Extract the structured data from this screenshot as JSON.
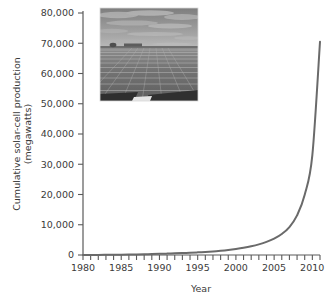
{
  "chart_data": {
    "type": "line",
    "title": "",
    "xlabel": "Year",
    "ylabel": "Cumulative solar-cell production (megawatts)",
    "ylabel_line1": "Cumulative solar-cell production",
    "ylabel_line2": "(megawatts)",
    "xlim": [
      1980,
      2011
    ],
    "ylim": [
      0,
      80000
    ],
    "grid": false,
    "legend": null,
    "x_tick_step": 1,
    "x_label_step": 5,
    "y_tick_step": 10000,
    "xticklabels": [
      "1980",
      "1985",
      "1990",
      "1995",
      "2000",
      "2005",
      "2010"
    ],
    "xticklabel_values": [
      1980,
      1985,
      1990,
      1995,
      2000,
      2005,
      2010
    ],
    "yticklabels": [
      "0",
      "10,000",
      "20,000",
      "30,000",
      "40,000",
      "50,000",
      "60,000",
      "70,000",
      "80,000"
    ],
    "yticklabel_values": [
      0,
      10000,
      20000,
      30000,
      40000,
      50000,
      60000,
      70000,
      80000
    ],
    "series": [
      {
        "name": "Cumulative solar-cell production",
        "color": "#6a6a6a",
        "x": [
          1980,
          1981,
          1982,
          1983,
          1984,
          1985,
          1986,
          1987,
          1988,
          1989,
          1990,
          1991,
          1992,
          1993,
          1994,
          1995,
          1996,
          1997,
          1998,
          1999,
          2000,
          2001,
          2002,
          2003,
          2004,
          2005,
          2006,
          2007,
          2008,
          2009,
          2010,
          2011
        ],
        "values": [
          5,
          15,
          30,
          55,
          85,
          120,
          160,
          205,
          255,
          315,
          380,
          455,
          540,
          635,
          745,
          870,
          1015,
          1190,
          1405,
          1670,
          2005,
          2405,
          2900,
          3520,
          4330,
          5420,
          6960,
          9240,
          13100,
          19900,
          33000,
          70500
        ]
      }
    ],
    "annotations": []
  },
  "inset_photo": {
    "name": "solar-panel-farm-photo",
    "description": "Grayscale photograph of a large solar panel array field under a cloudy sky",
    "sky_top": "#8e8e8e",
    "sky_bottom": "#b4b4b4",
    "panel_dark": "#4a4a4a",
    "panel_mid": "#6e6e6e",
    "panel_light": "#9a9a9a"
  },
  "style": {
    "axis_color": "#5a5a5a",
    "text_color": "#3b3b3b",
    "curve_color": "#6a6a6a",
    "background": "#ffffff"
  }
}
